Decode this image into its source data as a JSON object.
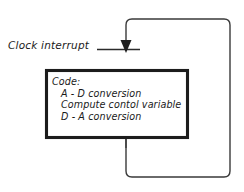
{
  "diagram": {
    "type": "control-loop-flow-diagram",
    "background_color": "#ffffff",
    "line_color": "#3a3a3a",
    "box_border_color": "#1c1c1c",
    "text_color": "#1a1a1a",
    "signal_label": "Clock interrupt",
    "code_box": {
      "title": "Code:",
      "steps": [
        "A - D conversion",
        "Compute contol variable",
        "D - A conversion"
      ]
    },
    "feedback_loop": {
      "shape": "rounded-rectangle",
      "description": "loop path returning from below the code box around to the arrow input"
    },
    "arrow": {
      "direction": "down",
      "target": "code-box"
    }
  }
}
